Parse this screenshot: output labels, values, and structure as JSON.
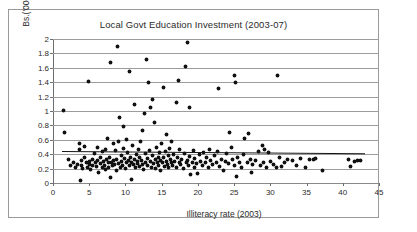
{
  "chart_data": {
    "type": "scatter",
    "title": "Local Govt Education Investment (2003-07)",
    "xlabel": "Illiteracy rate  (2003)",
    "ylabel": "Bs.('000) per capita",
    "xlim": [
      0,
      45
    ],
    "ylim": [
      0,
      2
    ],
    "xticks": [
      0,
      5,
      10,
      15,
      20,
      25,
      30,
      35,
      40,
      45
    ],
    "yticks": [
      0,
      0.2,
      0.4,
      0.6,
      0.8,
      1,
      1.2,
      1.4,
      1.6,
      1.8,
      2
    ],
    "xtick_labels": [
      "0",
      "5",
      "10",
      "15",
      "20",
      "25",
      "30",
      "35",
      "40",
      "45"
    ],
    "ytick_labels": [
      "0",
      "0.2",
      "0.4",
      "0.6",
      "0.8",
      "1",
      "1.2",
      "1.4",
      "1.6",
      "1.8",
      "2"
    ],
    "grid": "horizontal",
    "legend": null,
    "marker": "filled-diamond",
    "marker_color": "#111111",
    "gridline_color": "#9c9c9c",
    "trend_line": {
      "label": "linear fit",
      "color": "#151515",
      "x_start": 1.2,
      "y_start": 0.445,
      "x_end": 43.0,
      "y_end": 0.415
    },
    "points": [
      [
        1.5,
        1.01
      ],
      [
        1.6,
        0.7
      ],
      [
        2.2,
        0.33
      ],
      [
        2.4,
        0.24
      ],
      [
        2.8,
        0.29
      ],
      [
        3.1,
        0.22
      ],
      [
        3.4,
        0.26
      ],
      [
        3.6,
        0.55
      ],
      [
        3.7,
        0.46
      ],
      [
        3.8,
        0.03
      ],
      [
        3.9,
        0.31
      ],
      [
        4.0,
        0.24
      ],
      [
        4.1,
        0.2
      ],
      [
        4.3,
        0.35
      ],
      [
        4.4,
        0.51
      ],
      [
        4.6,
        0.28
      ],
      [
        4.8,
        0.22
      ],
      [
        4.9,
        1.41
      ],
      [
        5.0,
        0.3
      ],
      [
        5.1,
        0.26
      ],
      [
        5.2,
        0.19
      ],
      [
        5.4,
        0.33
      ],
      [
        5.5,
        0.24
      ],
      [
        5.7,
        0.41
      ],
      [
        5.8,
        0.29
      ],
      [
        6.0,
        0.23
      ],
      [
        6.1,
        0.5
      ],
      [
        6.2,
        0.31
      ],
      [
        6.3,
        0.14
      ],
      [
        6.5,
        0.27
      ],
      [
        6.6,
        0.36
      ],
      [
        6.8,
        0.22
      ],
      [
        6.9,
        0.44
      ],
      [
        7.0,
        0.3
      ],
      [
        7.1,
        0.25
      ],
      [
        7.2,
        0.19
      ],
      [
        7.3,
        0.47
      ],
      [
        7.4,
        0.33
      ],
      [
        7.5,
        0.62
      ],
      [
        7.6,
        0.28
      ],
      [
        7.7,
        0.21
      ],
      [
        7.8,
        0.35
      ],
      [
        7.9,
        1.68
      ],
      [
        8.0,
        0.08
      ],
      [
        8.1,
        0.29
      ],
      [
        8.2,
        0.24
      ],
      [
        8.3,
        0.55
      ],
      [
        8.4,
        0.31
      ],
      [
        8.5,
        0.26
      ],
      [
        8.6,
        0.45
      ],
      [
        8.7,
        0.18
      ],
      [
        8.8,
        0.33
      ],
      [
        8.9,
        1.9
      ],
      [
        9.0,
        0.27
      ],
      [
        9.1,
        0.58
      ],
      [
        9.2,
        0.91
      ],
      [
        9.3,
        0.22
      ],
      [
        9.4,
        0.38
      ],
      [
        9.5,
        0.3
      ],
      [
        9.6,
        0.25
      ],
      [
        9.7,
        0.48
      ],
      [
        9.8,
        0.79
      ],
      [
        9.9,
        0.34
      ],
      [
        10.0,
        0.2
      ],
      [
        10.1,
        0.28
      ],
      [
        10.2,
        0.6
      ],
      [
        10.3,
        0.43
      ],
      [
        10.4,
        0.31
      ],
      [
        10.5,
        1.55
      ],
      [
        10.6,
        0.24
      ],
      [
        10.7,
        0.36
      ],
      [
        10.8,
        0.05
      ],
      [
        10.9,
        0.29
      ],
      [
        11.0,
        0.52
      ],
      [
        11.1,
        0.26
      ],
      [
        11.2,
        1.09
      ],
      [
        11.3,
        0.33
      ],
      [
        11.4,
        0.21
      ],
      [
        11.5,
        0.4
      ],
      [
        11.6,
        0.3
      ],
      [
        11.7,
        0.27
      ],
      [
        11.8,
        0.46
      ],
      [
        11.9,
        0.23
      ],
      [
        12.0,
        0.35
      ],
      [
        12.1,
        0.57
      ],
      [
        12.2,
        0.31
      ],
      [
        12.3,
        0.73
      ],
      [
        12.4,
        0.26
      ],
      [
        12.5,
        0.19
      ],
      [
        12.6,
        0.97
      ],
      [
        12.7,
        0.41
      ],
      [
        12.8,
        0.29
      ],
      [
        12.9,
        1.71
      ],
      [
        13.0,
        0.34
      ],
      [
        13.1,
        0.24
      ],
      [
        13.2,
        1.4
      ],
      [
        13.3,
        0.45
      ],
      [
        13.4,
        1.05
      ],
      [
        13.5,
        0.3
      ],
      [
        13.6,
        0.22
      ],
      [
        13.7,
        1.16
      ],
      [
        13.8,
        0.38
      ],
      [
        13.9,
        0.27
      ],
      [
        14.0,
        0.84
      ],
      [
        14.1,
        0.32
      ],
      [
        14.2,
        0.2
      ],
      [
        14.3,
        0.49
      ],
      [
        14.4,
        0.28
      ],
      [
        14.5,
        0.36
      ],
      [
        14.6,
        0.24
      ],
      [
        14.7,
        0.42
      ],
      [
        14.8,
        0.31
      ],
      [
        14.9,
        0.17
      ],
      [
        15.0,
        0.55
      ],
      [
        15.1,
        0.29
      ],
      [
        15.2,
        1.32
      ],
      [
        15.3,
        0.35
      ],
      [
        15.4,
        0.23
      ],
      [
        15.5,
        0.44
      ],
      [
        15.6,
        0.67
      ],
      [
        15.7,
        0.3
      ],
      [
        15.8,
        0.26
      ],
      [
        15.9,
        0.38
      ],
      [
        16.0,
        0.21
      ],
      [
        16.1,
        0.48
      ],
      [
        16.2,
        0.33
      ],
      [
        16.3,
        0.28
      ],
      [
        16.4,
        0.57
      ],
      [
        16.5,
        0.25
      ],
      [
        16.6,
        0.4
      ],
      [
        16.8,
        0.3
      ],
      [
        17.0,
        1.12
      ],
      [
        17.1,
        0.22
      ],
      [
        17.2,
        0.35
      ],
      [
        17.3,
        1.42
      ],
      [
        17.4,
        0.29
      ],
      [
        17.5,
        0.46
      ],
      [
        17.6,
        0.26
      ],
      [
        17.8,
        0.33
      ],
      [
        18.0,
        0.2
      ],
      [
        18.2,
        0.41
      ],
      [
        18.3,
        1.62
      ],
      [
        18.4,
        0.28
      ],
      [
        18.5,
        1.95
      ],
      [
        18.6,
        0.31
      ],
      [
        18.7,
        0.24
      ],
      [
        18.8,
        1.05
      ],
      [
        18.9,
        0.37
      ],
      [
        19.0,
        0.12
      ],
      [
        19.2,
        0.29
      ],
      [
        19.4,
        0.45
      ],
      [
        19.5,
        0.22
      ],
      [
        19.6,
        0.34
      ],
      [
        19.8,
        0.27
      ],
      [
        20.0,
        0.13
      ],
      [
        20.2,
        0.39
      ],
      [
        20.4,
        0.3
      ],
      [
        20.6,
        0.25
      ],
      [
        20.8,
        0.43
      ],
      [
        21.0,
        0.28
      ],
      [
        21.2,
        0.35
      ],
      [
        21.4,
        0.21
      ],
      [
        21.6,
        0.47
      ],
      [
        21.8,
        0.31
      ],
      [
        22.0,
        0.26
      ],
      [
        22.3,
        0.38
      ],
      [
        22.5,
        0.29
      ],
      [
        22.7,
        0.44
      ],
      [
        22.9,
        1.31
      ],
      [
        23.0,
        0.23
      ],
      [
        23.2,
        0.33
      ],
      [
        23.5,
        0.18
      ],
      [
        23.8,
        0.3
      ],
      [
        24.0,
        0.41
      ],
      [
        24.2,
        0.27
      ],
      [
        24.4,
        0.7
      ],
      [
        24.6,
        0.49
      ],
      [
        24.8,
        0.32
      ],
      [
        25.0,
        1.5
      ],
      [
        25.1,
        0.24
      ],
      [
        25.2,
        1.39
      ],
      [
        25.3,
        0.09
      ],
      [
        25.5,
        0.36
      ],
      [
        25.8,
        0.29
      ],
      [
        26.0,
        0.22
      ],
      [
        26.3,
        0.4
      ],
      [
        26.5,
        0.62
      ],
      [
        26.8,
        0.28
      ],
      [
        27.0,
        0.69
      ],
      [
        27.2,
        0.33
      ],
      [
        27.4,
        0.15
      ],
      [
        27.6,
        0.26
      ],
      [
        28.0,
        0.31
      ],
      [
        28.3,
        0.44
      ],
      [
        28.6,
        0.24
      ],
      [
        28.9,
        0.52
      ],
      [
        29.0,
        0.29
      ],
      [
        29.2,
        0.47
      ],
      [
        29.5,
        0.22
      ],
      [
        29.8,
        0.43
      ],
      [
        30.0,
        0.3
      ],
      [
        30.4,
        0.26
      ],
      [
        30.8,
        0.21
      ],
      [
        31.0,
        1.49
      ],
      [
        31.3,
        0.35
      ],
      [
        31.6,
        0.23
      ],
      [
        32.0,
        0.28
      ],
      [
        32.4,
        0.33
      ],
      [
        33.0,
        0.31
      ],
      [
        33.6,
        0.25
      ],
      [
        34.2,
        0.34
      ],
      [
        34.9,
        0.21
      ],
      [
        35.4,
        0.32
      ],
      [
        35.9,
        0.33
      ],
      [
        36.3,
        0.34
      ],
      [
        37.2,
        0.18
      ],
      [
        40.8,
        0.33
      ],
      [
        41.0,
        0.23
      ],
      [
        41.6,
        0.3
      ],
      [
        42.0,
        0.31
      ],
      [
        42.4,
        0.31
      ]
    ]
  }
}
